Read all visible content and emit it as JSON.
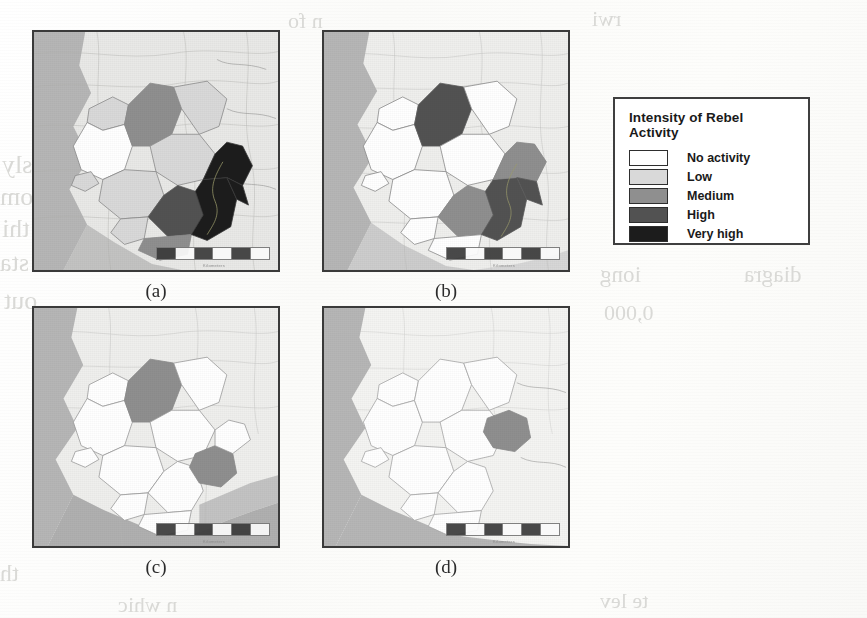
{
  "figure": {
    "kind": "choropleth-map-series",
    "region": "Sierra Leone",
    "panel_count": 4
  },
  "legend": {
    "title": "Intensity of Rebel Activity",
    "items": [
      {
        "label": "No activity",
        "color": "#ffffff"
      },
      {
        "label": "Low",
        "color": "#d9d9d9"
      },
      {
        "label": "Medium",
        "color": "#8f8f8f"
      },
      {
        "label": "High",
        "color": "#525252"
      },
      {
        "label": "Very high",
        "color": "#1c1c1c"
      }
    ]
  },
  "panels": [
    {
      "id": "a",
      "label": "(a)",
      "districts": [
        {
          "name": "kambia",
          "level": "Low",
          "color": "#d9d9d9"
        },
        {
          "name": "port-loko",
          "level": "No activity",
          "color": "#ffffff"
        },
        {
          "name": "bombali",
          "level": "Medium",
          "color": "#8f8f8f"
        },
        {
          "name": "koinadugu",
          "level": "Low",
          "color": "#d9d9d9"
        },
        {
          "name": "tonkolili",
          "level": "Low",
          "color": "#d9d9d9"
        },
        {
          "name": "western-area",
          "level": "Low",
          "color": "#d9d9d9"
        },
        {
          "name": "moyamba",
          "level": "Low",
          "color": "#d9d9d9"
        },
        {
          "name": "bo",
          "level": "High",
          "color": "#525252"
        },
        {
          "name": "bonthe",
          "level": "Low",
          "color": "#d9d9d9"
        },
        {
          "name": "pujehun",
          "level": "Medium",
          "color": "#8f8f8f"
        },
        {
          "name": "kenema",
          "level": "Very high",
          "color": "#1c1c1c"
        },
        {
          "name": "kailahun",
          "level": "Very high",
          "color": "#1c1c1c"
        }
      ]
    },
    {
      "id": "b",
      "label": "(b)",
      "districts": [
        {
          "name": "kambia",
          "level": "No activity",
          "color": "#ffffff"
        },
        {
          "name": "port-loko",
          "level": "No activity",
          "color": "#ffffff"
        },
        {
          "name": "bombali",
          "level": "High",
          "color": "#525252"
        },
        {
          "name": "koinadugu",
          "level": "No activity",
          "color": "#ffffff"
        },
        {
          "name": "tonkolili",
          "level": "No activity",
          "color": "#ffffff"
        },
        {
          "name": "western-area",
          "level": "No activity",
          "color": "#ffffff"
        },
        {
          "name": "moyamba",
          "level": "No activity",
          "color": "#ffffff"
        },
        {
          "name": "bo",
          "level": "Medium",
          "color": "#8f8f8f"
        },
        {
          "name": "bonthe",
          "level": "No activity",
          "color": "#ffffff"
        },
        {
          "name": "pujehun",
          "level": "No activity",
          "color": "#ffffff"
        },
        {
          "name": "kenema",
          "level": "High",
          "color": "#525252"
        },
        {
          "name": "kailahun",
          "level": "Medium",
          "color": "#8f8f8f"
        }
      ]
    },
    {
      "id": "c",
      "label": "(c)",
      "districts": [
        {
          "name": "kambia",
          "level": "No activity",
          "color": "#ffffff"
        },
        {
          "name": "port-loko",
          "level": "No activity",
          "color": "#ffffff"
        },
        {
          "name": "bombali",
          "level": "Medium",
          "color": "#8f8f8f"
        },
        {
          "name": "koinadugu",
          "level": "No activity",
          "color": "#ffffff"
        },
        {
          "name": "tonkolili",
          "level": "No activity",
          "color": "#ffffff"
        },
        {
          "name": "western-area",
          "level": "No activity",
          "color": "#ffffff"
        },
        {
          "name": "moyamba",
          "level": "No activity",
          "color": "#ffffff"
        },
        {
          "name": "bo",
          "level": "No activity",
          "color": "#ffffff"
        },
        {
          "name": "bonthe",
          "level": "No activity",
          "color": "#ffffff"
        },
        {
          "name": "pujehun",
          "level": "No activity",
          "color": "#ffffff"
        },
        {
          "name": "kenema",
          "level": "Medium",
          "color": "#8f8f8f"
        },
        {
          "name": "kailahun",
          "level": "No activity",
          "color": "#ffffff"
        }
      ]
    },
    {
      "id": "d",
      "label": "(d)",
      "districts": [
        {
          "name": "kambia",
          "level": "No activity",
          "color": "#ffffff"
        },
        {
          "name": "port-loko",
          "level": "No activity",
          "color": "#ffffff"
        },
        {
          "name": "bombali",
          "level": "No activity",
          "color": "#ffffff"
        },
        {
          "name": "koinadugu",
          "level": "No activity",
          "color": "#ffffff"
        },
        {
          "name": "tonkolili",
          "level": "No activity",
          "color": "#ffffff"
        },
        {
          "name": "western-area",
          "level": "No activity",
          "color": "#ffffff"
        },
        {
          "name": "moyamba",
          "level": "No activity",
          "color": "#ffffff"
        },
        {
          "name": "bo",
          "level": "No activity",
          "color": "#ffffff"
        },
        {
          "name": "bonthe",
          "level": "No activity",
          "color": "#ffffff"
        },
        {
          "name": "pujehun",
          "level": "No activity",
          "color": "#ffffff"
        },
        {
          "name": "kenema",
          "level": "Medium",
          "color": "#8f8f8f"
        },
        {
          "name": "kailahun",
          "level": "No activity",
          "color": "#ffffff"
        }
      ]
    }
  ],
  "basemap": {
    "ocean_color": "#b6b6b6",
    "neighbour_color": "#e9e9e7",
    "border_color": "#9a9a98"
  }
}
